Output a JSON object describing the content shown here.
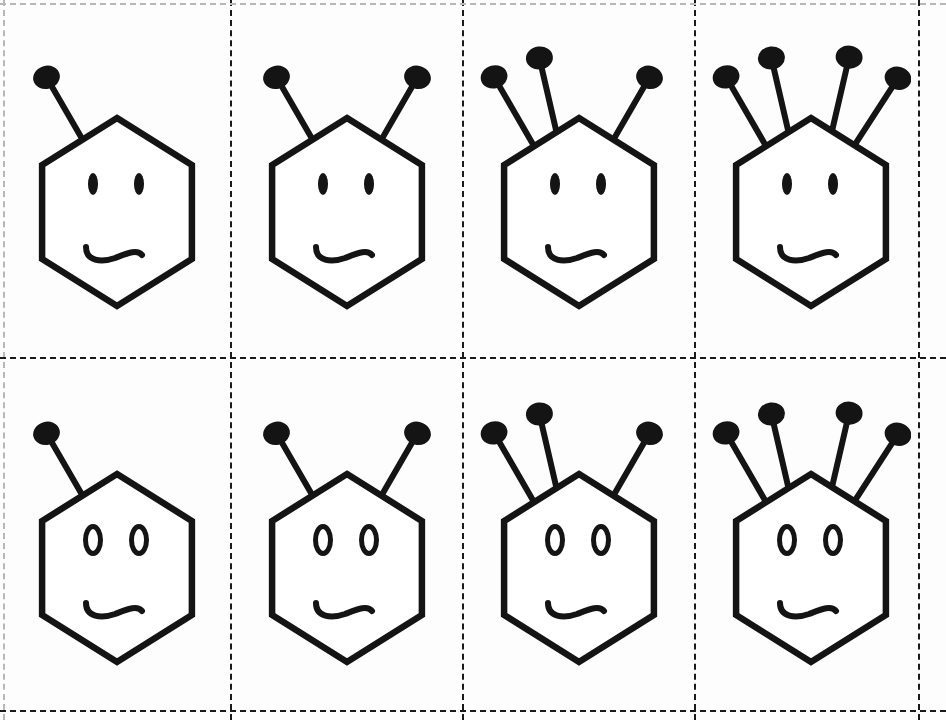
{
  "page": {
    "width": 946,
    "height": 720,
    "background_color": "#fdfdfd",
    "ink_color": "#141414"
  },
  "grid": {
    "rows": 2,
    "columns": 4,
    "line_style": "dashed",
    "line_color": "#1a1a1a",
    "faint_line_color": "#b8b8b8",
    "vertical_dividers_x": [
      3,
      230,
      462,
      694,
      918
    ],
    "horizontal_dividers_y": [
      3,
      357,
      710
    ]
  },
  "figures": [
    {
      "id": "figure-r1c1",
      "row": 1,
      "column": 1,
      "label": "hexagon face with 1 antenna and filled eyes",
      "antennae_total": 1,
      "antennae_left": 1,
      "antennae_right": 0,
      "eye_style": "filled",
      "mouth_style": "wavy",
      "shape": "hexagon",
      "cell_x": 6,
      "cell_y": 6,
      "cell_w": 222,
      "cell_h": 348
    },
    {
      "id": "figure-r1c2",
      "row": 1,
      "column": 2,
      "label": "hexagon face with 2 antennae and filled eyes",
      "antennae_total": 2,
      "antennae_left": 1,
      "antennae_right": 1,
      "eye_style": "filled",
      "mouth_style": "wavy",
      "shape": "hexagon",
      "cell_x": 234,
      "cell_y": 6,
      "cell_w": 226,
      "cell_h": 348
    },
    {
      "id": "figure-r1c3",
      "row": 1,
      "column": 3,
      "label": "hexagon face with 3 antennae and filled eyes",
      "antennae_total": 3,
      "antennae_left": 2,
      "antennae_right": 1,
      "eye_style": "filled",
      "mouth_style": "wavy",
      "shape": "hexagon",
      "cell_x": 466,
      "cell_y": 6,
      "cell_w": 226,
      "cell_h": 348
    },
    {
      "id": "figure-r1c4",
      "row": 1,
      "column": 4,
      "label": "hexagon face with 4 antennae and filled eyes",
      "antennae_total": 4,
      "antennae_left": 2,
      "antennae_right": 2,
      "eye_style": "filled",
      "mouth_style": "wavy",
      "shape": "hexagon",
      "cell_x": 698,
      "cell_y": 6,
      "cell_w": 226,
      "cell_h": 348
    },
    {
      "id": "figure-r2c1",
      "row": 2,
      "column": 1,
      "label": "hexagon face with 1 antenna and hollow eyes",
      "antennae_total": 1,
      "antennae_left": 1,
      "antennae_right": 0,
      "eye_style": "hollow",
      "mouth_style": "wavy",
      "shape": "hexagon",
      "cell_x": 6,
      "cell_y": 362,
      "cell_w": 222,
      "cell_h": 348
    },
    {
      "id": "figure-r2c2",
      "row": 2,
      "column": 2,
      "label": "hexagon face with 2 antennae and hollow eyes",
      "antennae_total": 2,
      "antennae_left": 1,
      "antennae_right": 1,
      "eye_style": "hollow",
      "mouth_style": "wavy",
      "shape": "hexagon",
      "cell_x": 234,
      "cell_y": 362,
      "cell_w": 226,
      "cell_h": 348
    },
    {
      "id": "figure-r2c3",
      "row": 2,
      "column": 3,
      "label": "hexagon face with 3 antennae and hollow eyes",
      "antennae_total": 3,
      "antennae_left": 2,
      "antennae_right": 1,
      "eye_style": "hollow",
      "mouth_style": "wavy",
      "shape": "hexagon",
      "cell_x": 466,
      "cell_y": 362,
      "cell_w": 226,
      "cell_h": 348
    },
    {
      "id": "figure-r2c4",
      "row": 2,
      "column": 4,
      "label": "hexagon face with 4 antennae and hollow eyes",
      "antennae_total": 4,
      "antennae_left": 2,
      "antennae_right": 2,
      "eye_style": "hollow",
      "mouth_style": "wavy",
      "shape": "hexagon",
      "cell_x": 698,
      "cell_y": 362,
      "cell_w": 226,
      "cell_h": 348
    }
  ]
}
